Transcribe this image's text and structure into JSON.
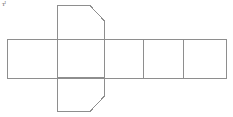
{
  "figure": {
    "name": "geometric-net-diagram",
    "corner_mark_text": "ᴛᴵ",
    "canvas": {
      "width": 233,
      "height": 117,
      "background": "#ffffff"
    },
    "stroke": {
      "color": "#8e8e8e",
      "width": 1,
      "fill": "none"
    }
  },
  "chart_data": {
    "type": "diagram",
    "title": "",
    "xlabel": "",
    "ylabel": "",
    "band": {
      "label": "horizontal-face-row",
      "x_left": 7,
      "x_right": 226,
      "y_top": 39,
      "y_bottom": 78,
      "divider_x": [
        57,
        105,
        143,
        183
      ]
    },
    "vertical_piece": {
      "label": "bevelled-vertical-face",
      "x_left": 57,
      "x_right": 105,
      "y_top": 5,
      "y_bottom": 112,
      "bevel_top_x": 90,
      "bevel_top_y": 5,
      "bevel_right_top_y": 21,
      "bevel_bottom_x": 90,
      "bevel_bottom_y": 112,
      "bevel_right_bottom_y": 96
    },
    "faces": [
      {
        "name": "face-1-left-rectangle",
        "x": 7,
        "y": 39,
        "width": 50,
        "height": 39
      },
      {
        "name": "face-2-center-rectangle",
        "x": 57,
        "y": 39,
        "width": 48,
        "height": 39
      },
      {
        "name": "face-3-wide-rectangle",
        "x": 105,
        "y": 39,
        "width": 38,
        "height": 39
      },
      {
        "name": "face-4-square",
        "x": 143,
        "y": 39,
        "width": 40,
        "height": 39
      },
      {
        "name": "face-5-square",
        "x": 183,
        "y": 39,
        "width": 43,
        "height": 39
      },
      {
        "name": "face-6-top-flap",
        "x": 57,
        "y": 5,
        "width": 48,
        "height": 34
      },
      {
        "name": "face-7-bottom-flap",
        "x": 57,
        "y": 78,
        "width": 48,
        "height": 34
      }
    ]
  }
}
